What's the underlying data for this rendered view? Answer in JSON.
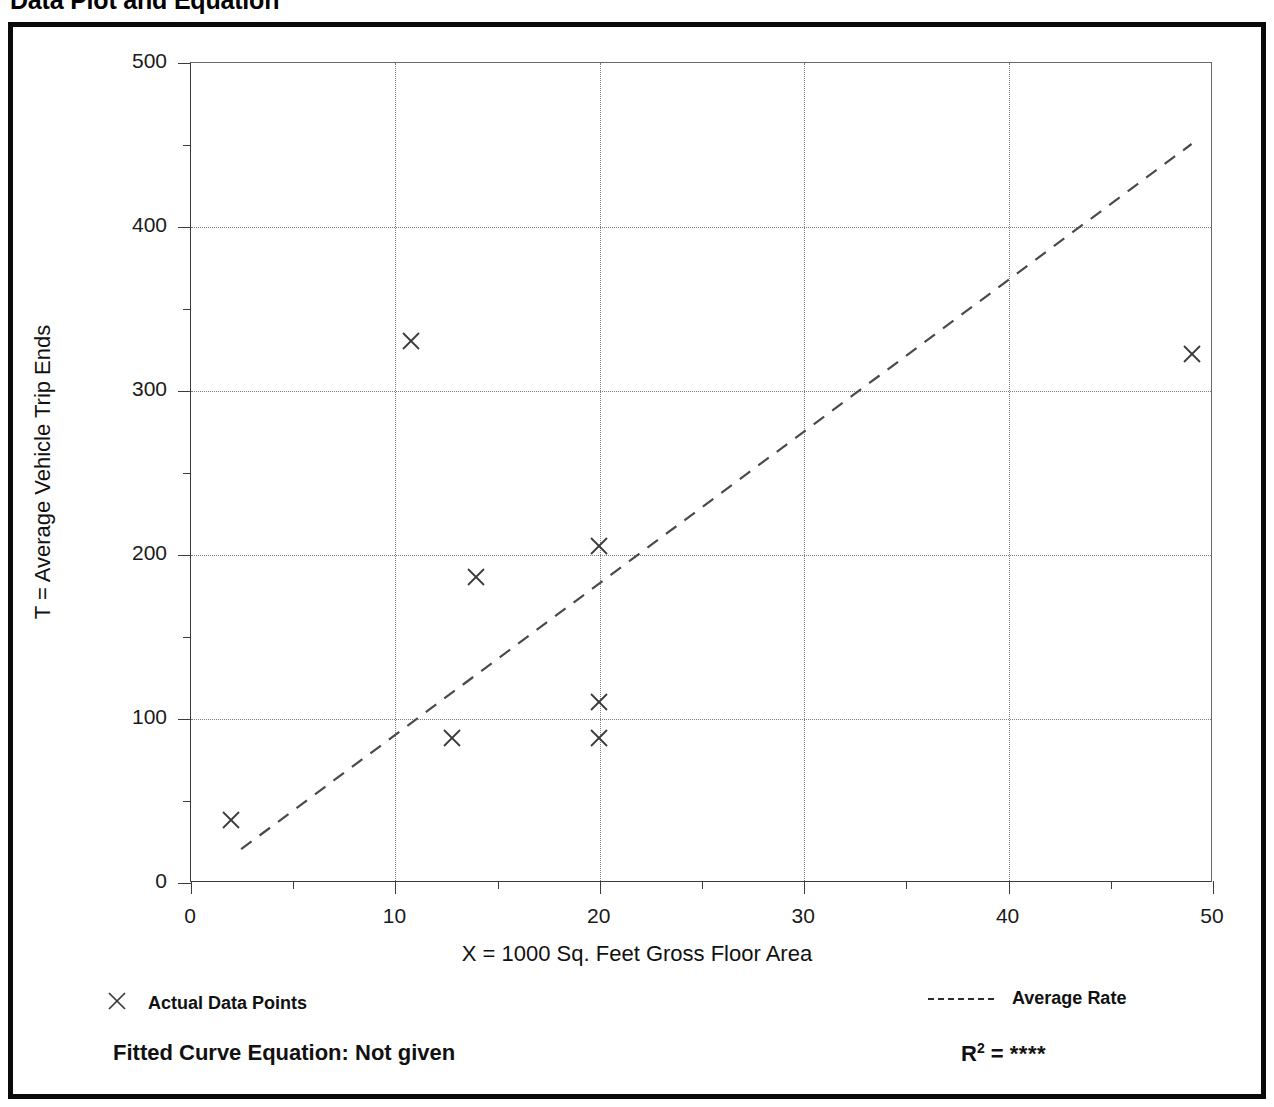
{
  "page": {
    "title": "Data Plot and Equation"
  },
  "chart_data": {
    "type": "scatter",
    "title": "Data Plot and Equation",
    "xlabel": "X = 1000 Sq. Feet Gross Floor Area",
    "ylabel": "T = Average Vehicle Trip Ends",
    "xlim": [
      0,
      50
    ],
    "ylim": [
      0,
      500
    ],
    "x_ticks": [
      0,
      10,
      20,
      30,
      40,
      50
    ],
    "x_tick_labels": [
      "0",
      "10",
      "20",
      "30",
      "40",
      "50"
    ],
    "x_minor_ticks": [
      5,
      15,
      25,
      35,
      45
    ],
    "y_ticks": [
      0,
      100,
      200,
      300,
      400,
      500
    ],
    "y_tick_labels": [
      "0",
      "100",
      "200",
      "300",
      "400",
      "500"
    ],
    "y_minor_ticks": [
      50,
      150,
      250,
      350,
      450
    ],
    "grid": true,
    "grid_style": "dotted",
    "series": [
      {
        "name": "Actual Data Points",
        "marker": "x",
        "points": [
          {
            "x": 2.0,
            "y": 38
          },
          {
            "x": 10.8,
            "y": 330
          },
          {
            "x": 12.8,
            "y": 88
          },
          {
            "x": 14.0,
            "y": 186
          },
          {
            "x": 20.0,
            "y": 205
          },
          {
            "x": 20.0,
            "y": 110
          },
          {
            "x": 20.0,
            "y": 88
          },
          {
            "x": 49.0,
            "y": 322
          }
        ]
      },
      {
        "name": "Average Rate",
        "marker": "dashed-line",
        "line": {
          "x1": 2.5,
          "y1": 20,
          "x2": 49.0,
          "y2": 450
        }
      }
    ],
    "legend": [
      {
        "key": "x-marker",
        "label": "Actual Data Points"
      },
      {
        "key": "dashed-line",
        "label": "Average Rate"
      }
    ],
    "annotations": {
      "fitted_curve_equation": "Fitted Curve Equation:  Not given",
      "r_squared_label": "R",
      "r_squared_exponent": "2",
      "r_squared_equals": " = ",
      "r_squared_value": "****"
    }
  },
  "colors": {
    "frame": "#0a0a0a",
    "axis": "#3b3b3b",
    "grid": "#7d7d7d",
    "marker": "#3a3a3a",
    "line": "#4a4a4a",
    "text": "#111111"
  }
}
